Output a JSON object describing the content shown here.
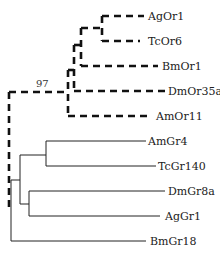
{
  "diagram": {
    "type": "phylogenetic-tree",
    "bootstrap_label": "97",
    "or_clade": {
      "style": "dashed-bold",
      "leaves": [
        "AgOr1",
        "TcOr6",
        "BmOr1",
        "DmOr35a",
        "AmOr11"
      ]
    },
    "gr_clade": {
      "style": "solid-thin",
      "leaves": [
        "AmGr4",
        "TcGr140",
        "DmGr8a",
        "AgGr1",
        "BmGr18"
      ]
    }
  }
}
